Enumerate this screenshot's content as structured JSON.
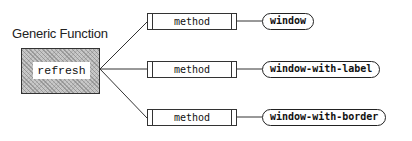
{
  "diagram": {
    "title": "Generic Function",
    "generic_function": {
      "name": "refresh"
    },
    "methods": [
      {
        "label": "method",
        "specializer": "window"
      },
      {
        "label": "method",
        "specializer": "window-with-label"
      },
      {
        "label": "method",
        "specializer": "window-with-border"
      }
    ],
    "colors": {
      "line": "#333333",
      "generic_box_fill": "#c8c8c8",
      "background": "#ffffff"
    }
  }
}
